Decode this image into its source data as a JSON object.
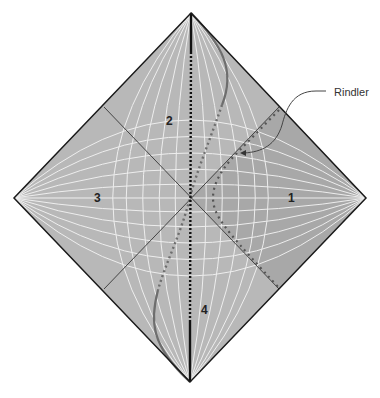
{
  "diagram": {
    "type": "penrose-diagram",
    "regions": [
      {
        "id": "1",
        "label": "1",
        "x": 291,
        "y": 201
      },
      {
        "id": "2",
        "label": "2",
        "x": 170,
        "y": 125
      },
      {
        "id": "3",
        "label": "3",
        "x": 98,
        "y": 201
      },
      {
        "id": "4",
        "label": "4",
        "x": 205,
        "y": 313
      }
    ],
    "annotations": [
      {
        "label": "Rindler",
        "x": 334,
        "y": 96
      }
    ],
    "colors": {
      "fill": "#b9b9b9",
      "region1_fill": "#a6a6a6",
      "grid": "#f2f2f2",
      "border": "#1a1a1a",
      "geodesic": "#6e6e6e",
      "rindler": "#555555",
      "axis": "#111111"
    },
    "vertices": {
      "top": [
        191,
        13
      ],
      "right": [
        366,
        198
      ],
      "bottom": [
        190,
        382
      ],
      "left": [
        14,
        198
      ]
    }
  }
}
